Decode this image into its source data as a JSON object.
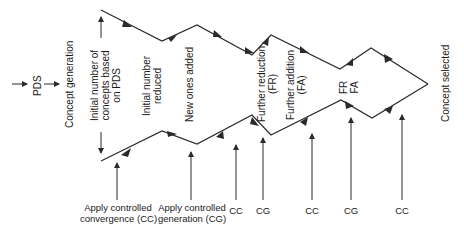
{
  "diagram": {
    "stages": {
      "pds": "PDS",
      "concept_generation": "Concept generation",
      "initial_concepts": [
        "Initial number of",
        "concepts based",
        "on PDS"
      ],
      "initial_reduced": [
        "Initial number",
        "reduced"
      ],
      "new_added": "New ones added",
      "further_reduction": [
        "Further reduction",
        "(FR)"
      ],
      "further_addition": [
        "Further addition",
        "(FA)"
      ],
      "fr_fa": [
        "FR",
        "FA"
      ],
      "concept_selected": "Concept selected"
    },
    "bottom_labels": [
      {
        "id": "cc1",
        "lines": [
          "Apply controlled",
          "convergence (CC)"
        ]
      },
      {
        "id": "cg1",
        "lines": [
          "Apply controlled",
          "generation (CG)"
        ]
      },
      {
        "id": "cc2",
        "lines": [
          "CC"
        ]
      },
      {
        "id": "cg2",
        "lines": [
          "CG"
        ]
      },
      {
        "id": "cc3",
        "lines": [
          "CC"
        ]
      },
      {
        "id": "cg3",
        "lines": [
          "CG"
        ]
      },
      {
        "id": "cc4",
        "lines": [
          "CC"
        ]
      }
    ],
    "colors": {
      "line": "#2a2a2a",
      "text": "#1a1a1a",
      "background": "#ffffff"
    }
  }
}
